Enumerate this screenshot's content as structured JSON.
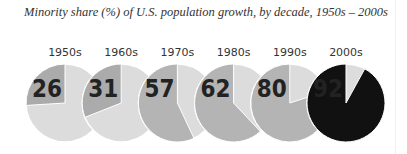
{
  "title": "Minority share (%) of U.S. population growth, by decade, 1950s – 2000s",
  "colors": {
    "remainder": "#dcdcdc",
    "share": "#b4b4b4",
    "share_early": "#ababab",
    "highlight": "#111111",
    "text": "#222222",
    "highlight_text": "#ffffff"
  },
  "chart_data": {
    "type": "pie",
    "title": "Minority share (%) of U.S. population growth, by decade, 1950s – 2000s",
    "categories": [
      "1950s",
      "1960s",
      "1970s",
      "1980s",
      "1990s",
      "2000s"
    ],
    "values": [
      26,
      31,
      57,
      62,
      80,
      92
    ],
    "unit": "%",
    "series": [
      {
        "name": "Minority share",
        "values": [
          26,
          31,
          57,
          62,
          80,
          92
        ]
      },
      {
        "name": "Remainder",
        "values": [
          74,
          69,
          43,
          38,
          20,
          8
        ]
      }
    ],
    "layout": {
      "arrangement": "row of small-multiple pies",
      "start_angle": "12 o'clock",
      "direction": "counterclockwise",
      "highlighted": "2000s",
      "legend": "none"
    }
  }
}
